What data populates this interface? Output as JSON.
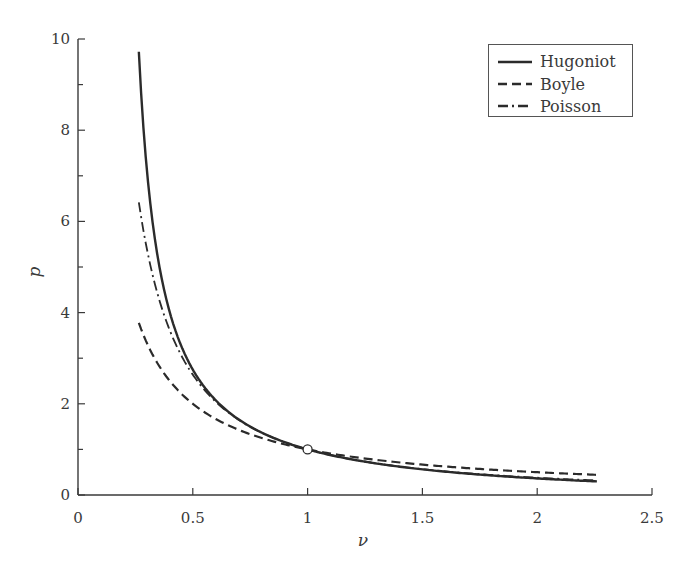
{
  "chart_data": {
    "type": "line",
    "title": "",
    "xlabel": "ν",
    "ylabel": "p",
    "xlim": [
      0,
      2.5
    ],
    "ylim": [
      0,
      10
    ],
    "grid": false,
    "legend_position": "upper right",
    "x_ticks": [
      0,
      0.5,
      1,
      1.5,
      2,
      2.5
    ],
    "x_tick_labels": [
      "0",
      "0.5",
      "1",
      "1.5",
      "2",
      "2.5"
    ],
    "y_ticks": [
      0,
      2,
      4,
      6,
      8,
      10
    ],
    "y_tick_labels": [
      "0",
      "2",
      "4",
      "6",
      "8",
      "10"
    ],
    "y_minor_ticks": [
      1,
      3,
      5,
      7,
      9
    ],
    "x": [
      0.265,
      0.28,
      0.3,
      0.33,
      0.36,
      0.4,
      0.45,
      0.5,
      0.55,
      0.6,
      0.7,
      0.8,
      0.9,
      1.0,
      1.1,
      1.2,
      1.3,
      1.4,
      1.5,
      1.6,
      1.7,
      1.8,
      1.9,
      2.0,
      2.1,
      2.2,
      2.26
    ],
    "series": [
      {
        "name": "Hugoniot",
        "style": "solid",
        "values": [
          9.7,
          7.67,
          5.92,
          4.47,
          3.6,
          2.88,
          2.3,
          1.91,
          1.63,
          1.43,
          1.14,
          0.95,
          0.81,
          1.0,
          0.91,
          0.82,
          0.74,
          0.67,
          0.61,
          0.56,
          0.51,
          0.47,
          0.43,
          0.4,
          0.36,
          0.31,
          0.3
        ]
      },
      {
        "name": "Boyle",
        "style": "dashed",
        "values": [
          3.77,
          3.57,
          3.33,
          3.03,
          2.78,
          2.5,
          2.22,
          2.0,
          1.82,
          1.67,
          1.43,
          1.25,
          1.11,
          1.0,
          0.91,
          0.83,
          0.77,
          0.71,
          0.67,
          0.63,
          0.59,
          0.56,
          0.53,
          0.5,
          0.48,
          0.45,
          0.44
        ]
      },
      {
        "name": "Poisson",
        "style": "dashdot",
        "values": [
          6.41,
          5.94,
          5.39,
          4.72,
          4.18,
          3.61,
          3.06,
          2.64,
          2.31,
          2.04,
          1.65,
          1.37,
          1.16,
          1.0,
          0.88,
          0.77,
          0.69,
          0.62,
          0.57,
          0.52,
          0.48,
          0.44,
          0.41,
          0.38,
          0.35,
          0.33,
          0.32
        ]
      }
    ],
    "annotations": [
      {
        "type": "open-circle-marker",
        "x": 1,
        "y": 1
      }
    ]
  },
  "legend": {
    "items": [
      {
        "label": "Hugoniot",
        "style": "solid"
      },
      {
        "label": "Boyle",
        "style": "dashed"
      },
      {
        "label": "Poisson",
        "style": "dashdot"
      }
    ]
  },
  "colors": {
    "line": "#2b2b2b",
    "axis": "#3a3a3a",
    "text": "#3a3a3a",
    "background": "#ffffff"
  }
}
